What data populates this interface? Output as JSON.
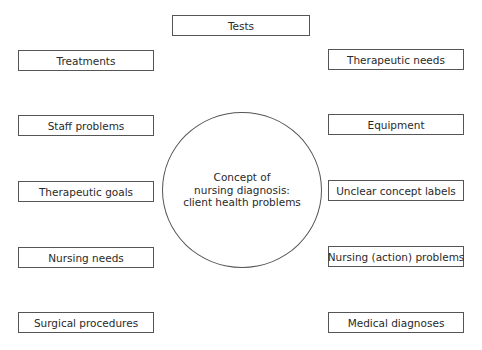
{
  "diagram": {
    "center": {
      "lines": [
        "Concept of",
        "nursing diagnosis:",
        "client health problems"
      ]
    },
    "top": {
      "label": "Tests"
    },
    "left": [
      {
        "label": "Treatments"
      },
      {
        "label": "Staff problems"
      },
      {
        "label": "Therapeutic goals"
      },
      {
        "label": "Nursing needs"
      },
      {
        "label": "Surgical procedures"
      }
    ],
    "right": [
      {
        "label": "Therapeutic needs"
      },
      {
        "label": "Equipment"
      },
      {
        "label": "Unclear concept labels"
      },
      {
        "label": "Nursing (action) problems"
      },
      {
        "label": "Medical diagnoses"
      }
    ]
  }
}
